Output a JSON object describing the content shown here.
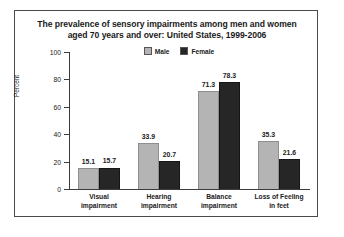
{
  "chart_data": {
    "type": "bar",
    "title": "The prevalence of sensory impairments among men and women aged 70 years and over: United States, 1999-2006",
    "title_line1": "The prevalence of sensory impairments among men and women",
    "title_line2": "aged 70 years and over: United States, 1999-2006",
    "categories": [
      "Visual impairment",
      "Hearing impairment",
      "Balance impairment",
      "Loss of Feeling in feet"
    ],
    "category_lines": [
      [
        "Visual",
        "impairment"
      ],
      [
        "Hearing",
        "impairment"
      ],
      [
        "Balance",
        "impairment"
      ],
      [
        "Loss of Feeling",
        "in feet"
      ]
    ],
    "series": [
      {
        "name": "Male",
        "values": [
          15.1,
          33.9,
          71.3,
          35.3
        ],
        "color": "#b4b4b4"
      },
      {
        "name": "Female",
        "values": [
          15.7,
          20.7,
          78.3,
          21.6
        ],
        "color": "#262626"
      }
    ],
    "xlabel": "",
    "ylabel": "Percent",
    "ylim": [
      0,
      100
    ],
    "yticks": [
      0,
      20,
      40,
      60,
      80,
      100
    ],
    "ytick_labels": [
      "0",
      "20",
      "40",
      "60",
      "80",
      "100"
    ],
    "grid": false,
    "legend_position": "top-center",
    "value_labels_shown": true
  }
}
